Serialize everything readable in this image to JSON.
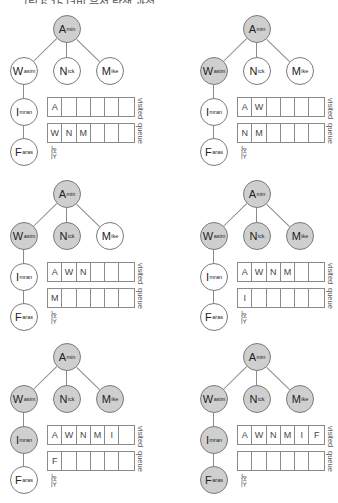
{
  "header_fragment": "그림 6-15 너비 우선 탐색 과정",
  "labels": {
    "visited": "visited",
    "queue": "queue",
    "start": "시작"
  },
  "colors": {
    "visited_node": "#cfcfcf",
    "unvisited_node": "#ffffff",
    "stroke": "#7a7a7a"
  },
  "nodes": {
    "A": {
      "main": "A",
      "sub": "min"
    },
    "W": {
      "main": "W",
      "sub": "asim"
    },
    "N": {
      "main": "N",
      "sub": "ick"
    },
    "M": {
      "main": "M",
      "sub": "ike"
    },
    "I": {
      "main": "I",
      "sub": "mran"
    },
    "F": {
      "main": "F",
      "sub": "aras"
    }
  },
  "steps": [
    {
      "visited_nodes": [
        "A"
      ],
      "visited": [
        "A",
        "",
        "",
        "",
        "",
        ""
      ],
      "queue": [
        "W",
        "N",
        "M",
        "",
        "",
        ""
      ]
    },
    {
      "visited_nodes": [
        "A",
        "W"
      ],
      "visited": [
        "A",
        "W",
        "",
        "",
        "",
        ""
      ],
      "queue": [
        "N",
        "M",
        "",
        "",
        "",
        ""
      ]
    },
    {
      "visited_nodes": [
        "A",
        "W",
        "N"
      ],
      "visited": [
        "A",
        "W",
        "N",
        "",
        "",
        ""
      ],
      "queue": [
        "M",
        "",
        "",
        "",
        "",
        ""
      ]
    },
    {
      "visited_nodes": [
        "A",
        "W",
        "N",
        "M"
      ],
      "visited": [
        "A",
        "W",
        "N",
        "M",
        "",
        ""
      ],
      "queue": [
        "I",
        "",
        "",
        "",
        "",
        ""
      ]
    },
    {
      "visited_nodes": [
        "A",
        "W",
        "N",
        "M",
        "I"
      ],
      "visited": [
        "A",
        "W",
        "N",
        "M",
        "I",
        ""
      ],
      "queue": [
        "F",
        "",
        "",
        "",
        "",
        ""
      ]
    },
    {
      "visited_nodes": [
        "A",
        "W",
        "N",
        "M",
        "I",
        "F"
      ],
      "visited": [
        "A",
        "W",
        "N",
        "M",
        "I",
        "F"
      ],
      "queue": [
        "",
        "",
        "",
        "",
        "",
        ""
      ]
    }
  ]
}
